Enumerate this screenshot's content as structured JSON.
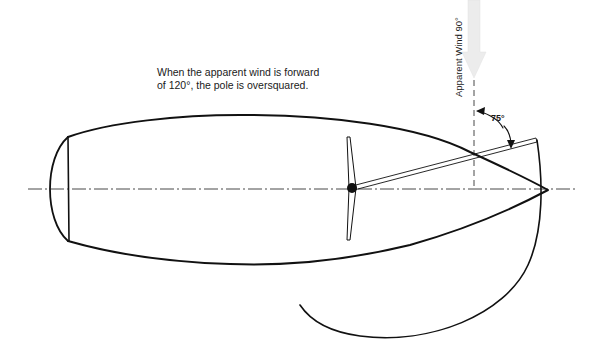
{
  "diagram": {
    "caption_line1": "When the apparent wind is forward",
    "caption_line2": "of 120°, the pole is oversquared.",
    "wind_label": "Apparent Wind 90°",
    "angle_label": "75°",
    "elements": {
      "hull": "boat-hull-outline",
      "centerline": "dash-dot-centerline",
      "mast": "mast-and-boom",
      "pole": "spinnaker-pole",
      "sail": "spinnaker-sheet-arc",
      "wind_arrow": "apparent-wind-arrow",
      "angle_arc": "pole-angle-arc"
    },
    "colors": {
      "line": "#111111",
      "wind_arrow": "#e6e6e6",
      "background": "#ffffff"
    }
  }
}
